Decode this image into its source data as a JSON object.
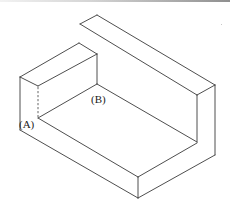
{
  "figure": {
    "type": "isometric-line-drawing",
    "labels": [
      {
        "id": "A",
        "text": "(A)"
      },
      {
        "id": "B",
        "text": "(B)"
      }
    ],
    "colors": {
      "line": "#3a3a3a",
      "hidden_line": "#555555",
      "background": "#ffffff"
    }
  }
}
